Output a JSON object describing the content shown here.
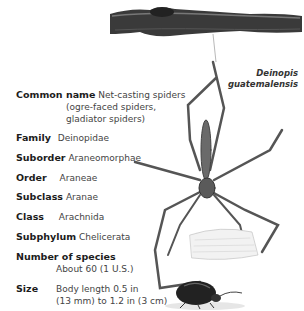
{
  "illustration": {
    "branch_icon": "branch-illustration",
    "spider_icon": "net-casting-spider-illustration",
    "beetle_icon": "beetle-scale-illustration",
    "species_label_line1": "Deinopis",
    "species_label_line2": "guatemalensis"
  },
  "facts": {
    "common_name": {
      "label": "Common name",
      "line1": "Net-casting spiders",
      "line2": "(ogre-faced spiders,",
      "line3": "gladiator spiders)"
    },
    "family": {
      "label": "Family",
      "value": "Deinopidae"
    },
    "suborder": {
      "label": "Suborder",
      "value": "Araneomorphae"
    },
    "order": {
      "label": "Order",
      "value": "Araneae"
    },
    "subclass": {
      "label": "Subclass",
      "value": "Aranae"
    },
    "class": {
      "label": "Class",
      "value": "Arachnida"
    },
    "subphylum": {
      "label": "Subphylum",
      "value": "Chelicerata"
    },
    "number_of_species": {
      "label": "Number of species",
      "value": "About 60 (1 U.S.)"
    },
    "size": {
      "label": "Size",
      "line1": "Body length 0.5 in",
      "line2": "(13 mm) to 1.2 in (3 cm)"
    }
  }
}
